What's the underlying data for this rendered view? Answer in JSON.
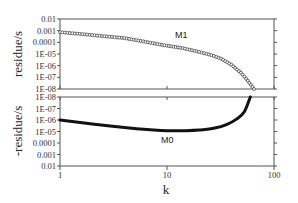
{
  "chart_data": [
    {
      "type": "scatter",
      "panel": "top",
      "title": "",
      "xlabel": "k",
      "ylabel": "residue/s",
      "xscale": "log",
      "yscale": "log",
      "xlim": [
        1,
        100
      ],
      "ylim": [
        1e-08,
        0.01
      ],
      "y_tick_labels": [
        "0.01",
        "0.001",
        "0.0001",
        "1E-05",
        "1E-06",
        "1E-07",
        "1E-08"
      ],
      "grid": false,
      "series": [
        {
          "name": "M1",
          "marker": "open-circle",
          "x": [
            1,
            2,
            4,
            6,
            9,
            14,
            20,
            26,
            32,
            40,
            49,
            57,
            65
          ],
          "y": [
            0.00075,
            0.00042,
            0.00023,
            0.00012,
            6e-05,
            3.2e-05,
            1.5e-05,
            8e-06,
            4e-06,
            1.2e-06,
            2.5e-07,
            5e-08,
            1e-08
          ]
        }
      ]
    },
    {
      "type": "line",
      "panel": "bottom",
      "title": "",
      "xlabel": "k",
      "ylabel": "-residue/s",
      "xscale": "log",
      "yscale": "log",
      "y_inverted": true,
      "xlim": [
        1,
        100
      ],
      "ylim": [
        1e-08,
        0.01
      ],
      "y_tick_labels": [
        "1E-08",
        "1E-07",
        "1E-06",
        "1E-05",
        "0.0001",
        "0.001",
        "0.01"
      ],
      "x_tick_labels": [
        "1",
        "10",
        "100"
      ],
      "grid": false,
      "series": [
        {
          "name": "M0",
          "x": [
            1,
            2,
            4,
            7,
            10,
            15,
            20,
            28,
            36,
            45,
            53,
            60
          ],
          "y": [
            1e-06,
            2.2e-06,
            4.5e-06,
            7e-06,
            8.5e-06,
            8.5e-06,
            7.5e-06,
            5e-06,
            2.5e-06,
            8e-07,
            1.8e-07,
            1e-08
          ]
        }
      ]
    }
  ],
  "labels": {
    "top_ylabel": "residue/s",
    "bottom_ylabel": "-residue/s",
    "xlabel": "k",
    "m1": "M1",
    "m0": "M0"
  },
  "top_ticks": [
    "0.01",
    "0.001",
    "0.0001",
    "1E-05",
    "1E-06",
    "1E-07",
    "1E-08"
  ],
  "bottom_ticks": [
    "1E-08",
    "1E-07",
    "1E-06",
    "1E-05",
    "0.0001",
    "0.001",
    "0.01"
  ],
  "x_ticks": [
    "1",
    "10",
    "100"
  ]
}
